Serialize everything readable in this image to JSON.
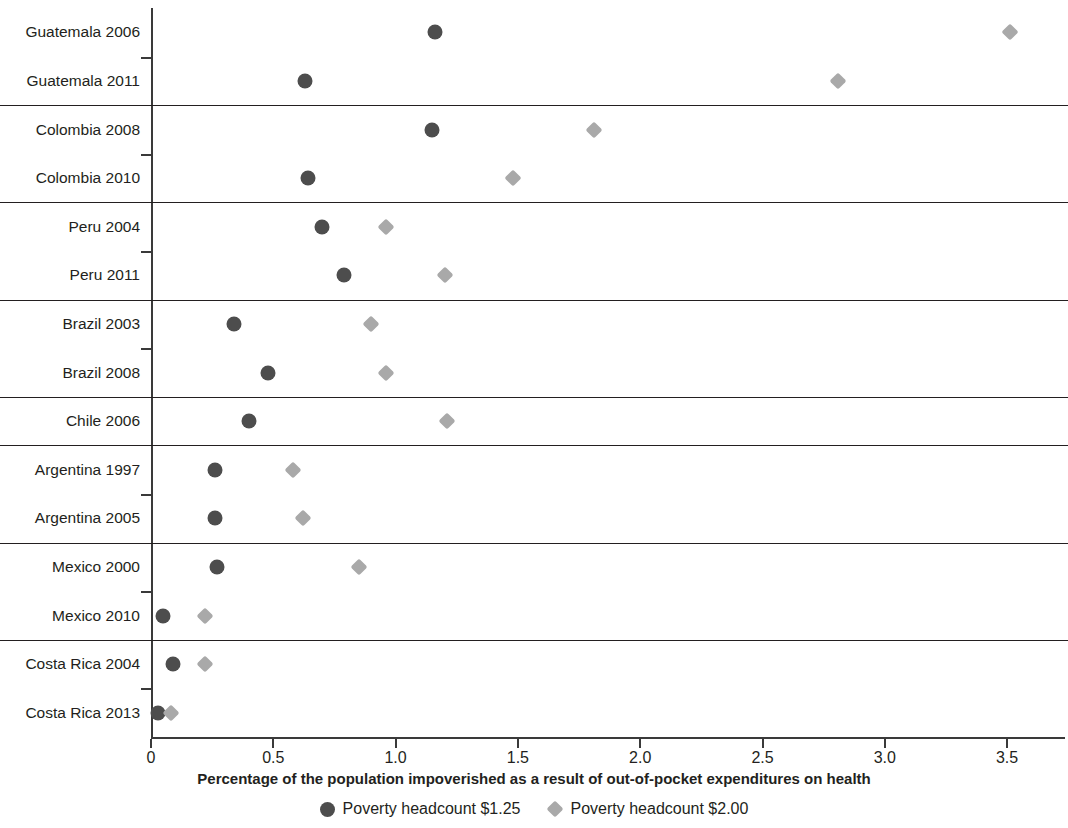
{
  "chart_data": {
    "type": "scatter",
    "title": "",
    "xlabel": "Percentage of the population impoverished as a result of out-of-pocket expenditures on health",
    "ylabel": "",
    "xlim": [
      0,
      3.6
    ],
    "xticks": [
      0,
      0.5,
      1.0,
      1.5,
      2.0,
      2.5,
      3.0,
      3.5
    ],
    "xtick_labels": [
      "0",
      "0.5",
      "1.0",
      "1.5",
      "2.0",
      "2.5",
      "3.0",
      "3.5"
    ],
    "grid": false,
    "legend_position": "bottom",
    "orientation": "horizontal",
    "series": [
      {
        "name": "Poverty headcount $1.25",
        "marker": "circle",
        "color": "#4d4d4d",
        "values": [
          1.16,
          0.63,
          1.15,
          0.64,
          0.7,
          0.79,
          0.34,
          0.48,
          0.4,
          0.26,
          0.26,
          0.27,
          0.05,
          0.09,
          0.03
        ]
      },
      {
        "name": "Poverty headcount $2.00",
        "marker": "diamond",
        "color": "#a9a9a9",
        "values": [
          3.51,
          2.81,
          1.81,
          1.48,
          0.96,
          1.2,
          0.9,
          0.96,
          1.21,
          0.58,
          0.62,
          0.85,
          0.22,
          0.22,
          0.08
        ]
      }
    ],
    "categories": [
      "Guatemala 2006",
      "Guatemala 2011",
      "Colombia 2008",
      "Colombia 2010",
      "Peru 2004",
      "Peru 2011",
      "Brazil 2003",
      "Brazil 2008",
      "Chile 2006",
      "Argentina 1997",
      "Argentina 2005",
      "Mexico 2000",
      "Mexico 2010",
      "Costa Rica 2004",
      "Costa Rica 2013"
    ],
    "group_breaks_after": [
      1,
      3,
      5,
      7,
      8,
      10,
      12
    ],
    "y_tick_between": [
      0,
      2,
      4,
      6,
      9,
      11,
      13
    ]
  },
  "legend": {
    "items": [
      {
        "label": "Poverty headcount $1.25",
        "marker": "circle",
        "color": "#4d4d4d"
      },
      {
        "label": "Poverty headcount $2.00",
        "marker": "diamond",
        "color": "#a9a9a9"
      }
    ]
  },
  "axis": {
    "x_title": "Percentage of the population impoverished as a result of out-of-pocket expenditures on health"
  }
}
